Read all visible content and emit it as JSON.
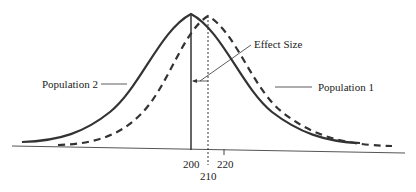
{
  "diagram": {
    "type": "overlapping normal distributions",
    "labels": {
      "effect_size": "Effect Size",
      "population_1": "Population 1",
      "population_2": "Population 2"
    },
    "axis": {
      "ticks": [
        {
          "value": "200"
        },
        {
          "value": "210"
        },
        {
          "value": "220"
        }
      ]
    },
    "series": [
      {
        "name": "Population 2",
        "mean": 200,
        "style": "solid"
      },
      {
        "name": "Population 1",
        "mean": 210,
        "style": "dashed"
      }
    ],
    "colors": {
      "line": "#333333",
      "text": "#222222"
    }
  }
}
